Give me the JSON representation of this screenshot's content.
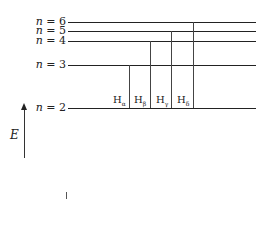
{
  "diagram": {
    "levels": [
      {
        "n": "6",
        "label_var": "n",
        "label_rest": " = 6",
        "y": 22
      },
      {
        "n": "5",
        "label_var": "n",
        "label_rest": " = 5",
        "y": 31
      },
      {
        "n": "4",
        "label_var": "n",
        "label_rest": " = 4",
        "y": 41
      },
      {
        "n": "3",
        "label_var": "n",
        "label_rest": " = 3",
        "y": 65
      },
      {
        "n": "2",
        "label_var": "n",
        "label_rest": " = 2",
        "y": 108
      }
    ],
    "transitions": [
      {
        "base": "H",
        "sub": "α",
        "from": "3",
        "to": "2",
        "x": 129
      },
      {
        "base": "H",
        "sub": "β",
        "from": "4",
        "to": "2",
        "x": 150
      },
      {
        "base": "H",
        "sub": "γ",
        "from": "5",
        "to": "2",
        "x": 171
      },
      {
        "base": "H",
        "sub": "δ",
        "from": "6",
        "to": "2",
        "x": 193
      }
    ],
    "axis": {
      "label": "E",
      "direction": "up"
    }
  }
}
